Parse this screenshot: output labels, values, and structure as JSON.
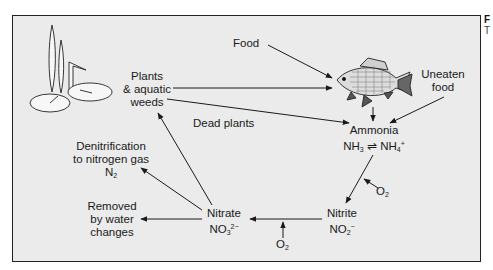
{
  "diagram": {
    "type": "nitrogen-cycle-aquarium",
    "nodes": {
      "plants": [
        "Plants",
        "& aquatic",
        "weeds"
      ],
      "food": "Food",
      "uneaten_food": [
        "Uneaten",
        "food"
      ],
      "dead_plants": "Dead plants",
      "ammonia": {
        "name": "Ammonia",
        "formula_a": "NH",
        "sub_a": "3",
        "formula_b": "NH",
        "sub_b": "4",
        "sup_b": "+"
      },
      "nitrite": {
        "name": "Nitrite",
        "formula": "NO",
        "sub": "2",
        "sup": "−"
      },
      "nitrate": {
        "name": "Nitrate",
        "formula": "NO",
        "sub": "3",
        "sup": "2−"
      },
      "denitrification": [
        "Denitrification",
        "to nitrogen gas"
      ],
      "n2": {
        "formula": "N",
        "sub": "2"
      },
      "removed": [
        "Removed",
        "by water",
        "changes"
      ],
      "o2": {
        "formula": "O",
        "sub": "2"
      }
    },
    "edges": [
      {
        "from": "Food",
        "to": "Fish"
      },
      {
        "from": "Plants & aquatic weeds",
        "to": "Fish"
      },
      {
        "from": "Plants & aquatic weeds",
        "to": "Ammonia",
        "label": "Dead plants"
      },
      {
        "from": "Fish",
        "to": "Ammonia"
      },
      {
        "from": "Uneaten food",
        "to": "Ammonia"
      },
      {
        "from": "Ammonia",
        "to": "Nitrite",
        "input": "O2"
      },
      {
        "from": "Nitrite",
        "to": "Nitrate",
        "input": "O2"
      },
      {
        "from": "Nitrate",
        "to": "Plants & aquatic weeds"
      },
      {
        "from": "Nitrate",
        "to": "Denitrification to nitrogen gas N2"
      },
      {
        "from": "Nitrate",
        "to": "Removed by water changes"
      }
    ]
  },
  "side_text": {
    "top": "F",
    "bottom": "T"
  }
}
